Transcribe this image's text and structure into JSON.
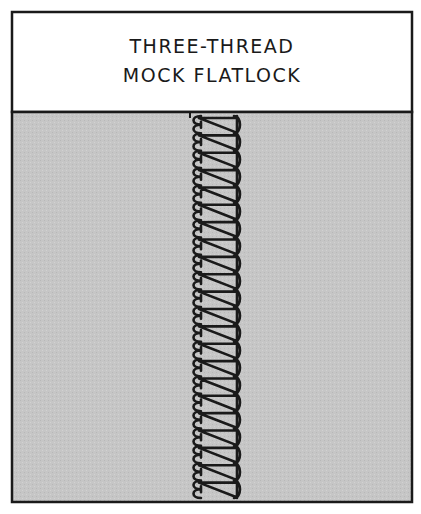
{
  "title": {
    "line1": "THREE-THREAD",
    "line2": "MOCK FLATLOCK"
  },
  "colors": {
    "background": "#ffffff",
    "fabric": "#c8c8c8",
    "ink": "#1a1a1a"
  },
  "stitch": {
    "name": "three-thread mock flatlock seam",
    "loop_count": 22
  }
}
